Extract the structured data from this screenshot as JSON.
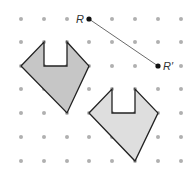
{
  "diagram": {
    "grid": {
      "xs": [
        21,
        44,
        67,
        89,
        112,
        135,
        158,
        181
      ],
      "ys": [
        19,
        42,
        66,
        89,
        113,
        137,
        161
      ],
      "dot_color": "#b0b0b0"
    },
    "segment": {
      "start": {
        "label": "R",
        "x": 89,
        "y": 19
      },
      "end": {
        "label": "R′",
        "x": 158,
        "y": 66
      }
    },
    "shapes": [
      {
        "name": "original",
        "fill": "#c6c6c6",
        "points": "21,66 44,42 44,66 67,66 67,42 89,66 67,113"
      },
      {
        "name": "image",
        "fill": "#dedede",
        "points": "89,113 112,89 112,113 135,113 135,89 158,113 135,161"
      }
    ]
  }
}
